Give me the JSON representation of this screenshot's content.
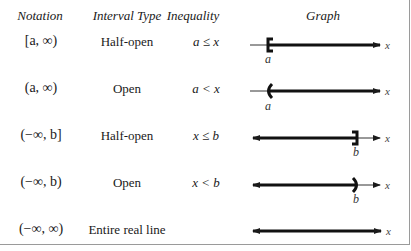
{
  "table": {
    "headers": {
      "notation": "Notation",
      "interval_type": "Interval Type",
      "inequality": "Inequality",
      "graph": "Graph"
    },
    "rows": [
      {
        "notation": "[a, ∞)",
        "interval_type": "Half-open",
        "inequality": "a ≤ x",
        "graph": {
          "endpoint": "closed",
          "side": "left",
          "label": "a",
          "axis_label": "x"
        }
      },
      {
        "notation": "(a, ∞)",
        "interval_type": "Open",
        "inequality": "a < x",
        "graph": {
          "endpoint": "open",
          "side": "left",
          "label": "a",
          "axis_label": "x"
        }
      },
      {
        "notation": "(−∞, b]",
        "interval_type": "Half-open",
        "inequality": "x ≤ b",
        "graph": {
          "endpoint": "closed",
          "side": "right",
          "label": "b",
          "axis_label": "x"
        }
      },
      {
        "notation": "(−∞, b)",
        "interval_type": "Open",
        "inequality": "x < b",
        "graph": {
          "endpoint": "open",
          "side": "right",
          "label": "b",
          "axis_label": "x"
        }
      },
      {
        "notation": "(−∞, ∞)",
        "interval_type": "Entire real line",
        "inequality": "",
        "graph": {
          "endpoint": "none",
          "side": "both",
          "label": "",
          "axis_label": "x"
        }
      }
    ]
  }
}
